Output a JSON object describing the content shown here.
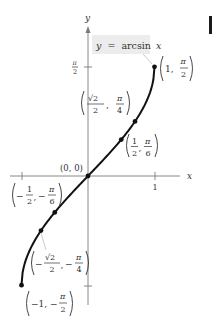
{
  "chart_data": {
    "type": "line",
    "title": "y = arcsin x",
    "function": "arcsin",
    "xlabel": "x",
    "ylabel": "y",
    "xlim": [
      -1,
      1
    ],
    "ylim": [
      -1.5708,
      1.5708
    ],
    "x_ticks": [
      {
        "value": -1,
        "label": ""
      },
      {
        "value": 1,
        "label": "1"
      }
    ],
    "y_ticks": [
      {
        "value": 1.5708,
        "label": "π/2"
      },
      {
        "value": -1.5708,
        "label": ""
      }
    ],
    "grid": false,
    "series": [
      {
        "name": "y = arcsin x",
        "x": [
          -1,
          -0.866,
          -0.707,
          -0.5,
          -0.25,
          0,
          0.25,
          0.5,
          0.707,
          0.866,
          1
        ],
        "y": [
          -1.5708,
          -1.0472,
          -0.7854,
          -0.5236,
          -0.2527,
          0,
          0.2527,
          0.5236,
          0.7854,
          1.0472,
          1.5708
        ]
      }
    ],
    "labeled_points": [
      {
        "x": 1,
        "y": 1.5708,
        "label": "(1, π/2)"
      },
      {
        "x": 0.7071,
        "y": 0.7854,
        "label": "(√2/2, π/4)"
      },
      {
        "x": 0.5,
        "y": 0.5236,
        "label": "(1/2, π/6)"
      },
      {
        "x": 0,
        "y": 0,
        "label": "(0, 0)"
      },
      {
        "x": -0.5,
        "y": -0.5236,
        "label": "(−1/2, −π/6)"
      },
      {
        "x": -0.7071,
        "y": -0.7854,
        "label": "(−√2/2, −π/4)"
      },
      {
        "x": -1,
        "y": -1.5708,
        "label": "(−1, −π/2)"
      }
    ]
  },
  "labels": {
    "equation_y": "y",
    "equation_eq": "=",
    "equation_fn": "arcsin",
    "equation_x": "x",
    "axis_x": "x",
    "axis_y": "y",
    "tick_x_one": "1",
    "tick_y_pi": "π",
    "tick_y_two": "2",
    "origin": "(0, 0)",
    "p1_x": "1,",
    "p1_num": "π",
    "p1_den": "2",
    "p2_xnum": "√2",
    "p2_xden": "2",
    "p2_num": "π",
    "p2_den": "4",
    "p3_xnum": "1",
    "p3_xden": "2",
    "p3_num": "π",
    "p3_den": "6",
    "p4_xnum": "1",
    "p4_xden": "2",
    "p4_num": "π",
    "p4_den": "6",
    "p5_xnum": "√2",
    "p5_xden": "2",
    "p5_num": "π",
    "p5_den": "4",
    "p6_x": "−1,",
    "p6_num": "π",
    "p6_den": "2",
    "minus": "−",
    "comma": ","
  },
  "colors": {
    "curve": "#111111",
    "axis": "#7a7a7a",
    "label_box": "#ececec",
    "text": "#333333"
  }
}
